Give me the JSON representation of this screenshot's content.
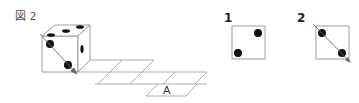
{
  "figure": {
    "label": "図 2",
    "net_cell_label": "A"
  },
  "options": [
    {
      "number": "1",
      "pips": 2,
      "arrow": false
    },
    {
      "number": "2",
      "pips": 2,
      "arrow": true
    }
  ],
  "colors": {
    "line": "#888888",
    "pip": "#111111",
    "arrow": "#666666"
  }
}
